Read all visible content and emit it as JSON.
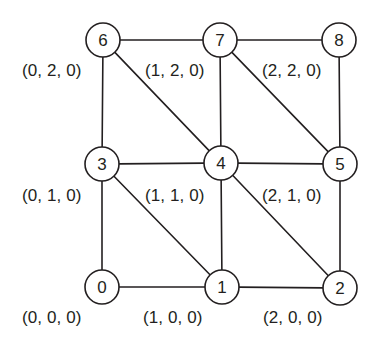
{
  "diagram": {
    "stroke_color": "#231f20",
    "node_fill": "#ffffff",
    "background": "#ffffff",
    "node_radius": 17,
    "nodes": [
      {
        "id": "node-0",
        "label": "0",
        "cx": 102,
        "cy": 287
      },
      {
        "id": "node-1",
        "label": "1",
        "cx": 222,
        "cy": 287
      },
      {
        "id": "node-2",
        "label": "2",
        "cx": 340,
        "cy": 288
      },
      {
        "id": "node-3",
        "label": "3",
        "cx": 102,
        "cy": 164
      },
      {
        "id": "node-4",
        "label": "4",
        "cx": 221,
        "cy": 163
      },
      {
        "id": "node-5",
        "label": "5",
        "cx": 340,
        "cy": 164
      },
      {
        "id": "node-6",
        "label": "6",
        "cx": 103,
        "cy": 40
      },
      {
        "id": "node-7",
        "label": "7",
        "cx": 220,
        "cy": 40
      },
      {
        "id": "node-8",
        "label": "8",
        "cx": 339,
        "cy": 40
      }
    ],
    "edges": [
      {
        "id": "edge-0-1",
        "from": 0,
        "to": 1,
        "kind": "horizontal"
      },
      {
        "id": "edge-1-2",
        "from": 1,
        "to": 2,
        "kind": "horizontal"
      },
      {
        "id": "edge-3-4",
        "from": 3,
        "to": 4,
        "kind": "horizontal"
      },
      {
        "id": "edge-4-5",
        "from": 4,
        "to": 5,
        "kind": "horizontal"
      },
      {
        "id": "edge-6-7",
        "from": 6,
        "to": 7,
        "kind": "horizontal"
      },
      {
        "id": "edge-7-8",
        "from": 7,
        "to": 8,
        "kind": "horizontal"
      },
      {
        "id": "edge-0-3",
        "from": 0,
        "to": 3,
        "kind": "vertical"
      },
      {
        "id": "edge-3-6",
        "from": 3,
        "to": 6,
        "kind": "vertical"
      },
      {
        "id": "edge-1-4",
        "from": 1,
        "to": 4,
        "kind": "vertical"
      },
      {
        "id": "edge-4-7",
        "from": 4,
        "to": 7,
        "kind": "vertical"
      },
      {
        "id": "edge-2-5",
        "from": 2,
        "to": 5,
        "kind": "vertical"
      },
      {
        "id": "edge-5-8",
        "from": 5,
        "to": 8,
        "kind": "vertical"
      },
      {
        "id": "edge-3-1",
        "from": 3,
        "to": 1,
        "kind": "diagonal"
      },
      {
        "id": "edge-4-2",
        "from": 4,
        "to": 2,
        "kind": "diagonal"
      },
      {
        "id": "edge-6-4",
        "from": 6,
        "to": 4,
        "kind": "diagonal"
      },
      {
        "id": "edge-7-5",
        "from": 7,
        "to": 5,
        "kind": "diagonal"
      }
    ],
    "coordinate_labels": [
      {
        "id": "coord-0-2-0",
        "text": "(0, 2, 0)",
        "x": 22,
        "y": 71
      },
      {
        "id": "coord-1-2-0",
        "text": "(1, 2, 0)",
        "x": 145,
        "y": 71
      },
      {
        "id": "coord-2-2-0",
        "text": "(2, 2, 0)",
        "x": 262,
        "y": 71
      },
      {
        "id": "coord-0-1-0",
        "text": "(0, 1, 0)",
        "x": 22,
        "y": 196
      },
      {
        "id": "coord-1-1-0",
        "text": "(1, 1, 0)",
        "x": 145,
        "y": 196
      },
      {
        "id": "coord-2-1-0",
        "text": "(2, 1, 0)",
        "x": 262,
        "y": 196
      },
      {
        "id": "coord-0-0-0",
        "text": "(0, 0, 0)",
        "x": 22,
        "y": 318
      },
      {
        "id": "coord-1-0-0",
        "text": "(1, 0, 0)",
        "x": 143,
        "y": 318
      },
      {
        "id": "coord-2-0-0",
        "text": "(2, 0, 0)",
        "x": 263,
        "y": 318
      }
    ]
  }
}
